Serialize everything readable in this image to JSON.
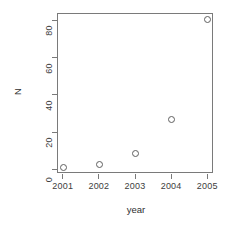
{
  "chart_data": {
    "type": "scatter",
    "title": "",
    "xlabel": "year",
    "ylabel": "N",
    "x": [
      2001,
      2002,
      2003,
      2004,
      2005
    ],
    "values": [
      1,
      3,
      9,
      27,
      81
    ],
    "categories": [
      "2001",
      "2002",
      "2003",
      "2004",
      "2005"
    ],
    "xlim": [
      2000.84,
      2005.16
    ],
    "ylim": [
      -2,
      84
    ],
    "xticks": [
      2001,
      2002,
      2003,
      2004,
      2005
    ],
    "xticklabels": [
      "2001",
      "2002",
      "2003",
      "2004",
      "2005"
    ],
    "yticks": [
      0,
      20,
      40,
      60,
      80
    ],
    "yticklabels": [
      "0",
      "20",
      "40",
      "60",
      "80"
    ],
    "grid": false,
    "legend": null,
    "marker": "open-circle",
    "marker_color": "#5f5f5f",
    "frame_color": "#7a7a7a",
    "background": "#ffffff",
    "points": [
      {
        "label": "2001",
        "x": 2001,
        "y": 1
      },
      {
        "label": "2002",
        "x": 2002,
        "y": 3
      },
      {
        "label": "2003",
        "x": 2003,
        "y": 9
      },
      {
        "label": "2004",
        "x": 2004,
        "y": 27
      },
      {
        "label": "2005",
        "x": 2005,
        "y": 81
      }
    ]
  }
}
